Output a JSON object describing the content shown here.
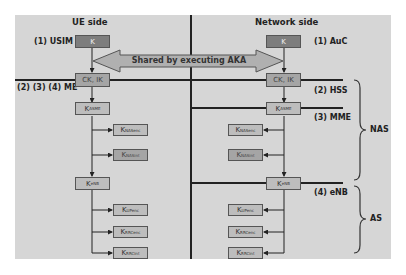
{
  "headers": {
    "ue": "UE side",
    "network": "Network side"
  },
  "shared_arrow": "Shared by executing AKA",
  "ue_labels": {
    "usim": "(1) USIM",
    "me": "(2) (3) (4) ME"
  },
  "network_labels": {
    "auc": "(1) AuC",
    "hss": "(2) HSS",
    "mme": "(3) MME",
    "enb": "(4) eNB"
  },
  "layers": {
    "nas": "NAS",
    "as": "AS"
  },
  "keys": {
    "k": {
      "main": "K",
      "sub": ""
    },
    "ckik": {
      "main": "CK, IK",
      "sub": ""
    },
    "kasme": {
      "main": "K",
      "sub": "ASME"
    },
    "knasenc": {
      "main": "K",
      "sub": "NASenc"
    },
    "knasint": {
      "main": "K",
      "sub": "NASint"
    },
    "kenb": {
      "main": "K",
      "sub": "eNB"
    },
    "kupenc": {
      "main": "K",
      "sub": "UPenc"
    },
    "krrcenc": {
      "main": "K",
      "sub": "RRCenc"
    },
    "krrcint": {
      "main": "K",
      "sub": "RRCint"
    }
  },
  "colors": {
    "panel": "#d6d6d6",
    "box_dark": "#7d7d7d",
    "box_light": "#bdbdbd",
    "line": "#222222",
    "arrow_fill": "#b0b0b0"
  }
}
